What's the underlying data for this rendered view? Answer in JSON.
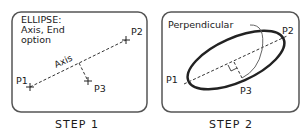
{
  "step1": {
    "caption": "STEP 1",
    "prompt_line1": "ELLIPSE:",
    "prompt_line2": "Axis, End",
    "prompt_line3": "option",
    "axis_label": "Axis",
    "p1": "P1",
    "p2": "P2",
    "p3": "P3"
  },
  "step2": {
    "caption": "STEP 2",
    "perpendicular_label": "Perpendicular",
    "p1": "P1",
    "p2": "P2",
    "p3": "P3"
  }
}
